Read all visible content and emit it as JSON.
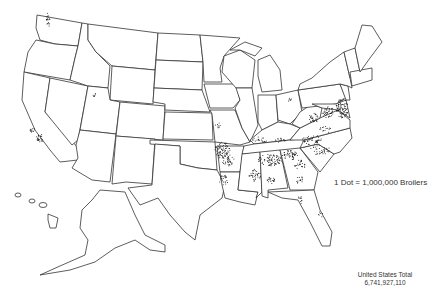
{
  "map": {
    "title": "Broiler production by county, dot density map of the United States",
    "legend": {
      "dot_value_label": "1 Dot = 1,000,000 Broilers"
    },
    "total": {
      "label": "United States Total",
      "value": "6,741,927,110"
    },
    "colors": {
      "outline": "#333333",
      "dots": "#1a1a1a",
      "background": "#ffffff"
    },
    "dense_regions": [
      "Delmarva Peninsula",
      "Northwest Arkansas",
      "North Georgia",
      "North Alabama",
      "Central Mississippi",
      "North Carolina",
      "Shenandoah Valley",
      "East Texas",
      "Central California",
      "Western Washington"
    ]
  }
}
